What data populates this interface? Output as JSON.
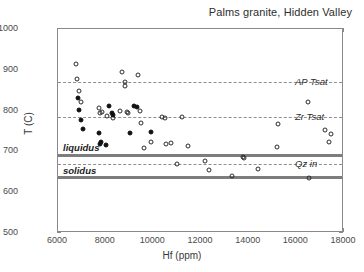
{
  "chart_data": {
    "type": "scatter",
    "title": "Palms granite, Hidden Valley",
    "xlabel": "Hf (ppm)",
    "ylabel": "T (C)",
    "xlim": [
      6000,
      18000
    ],
    "ylim": [
      500,
      1000
    ],
    "xticks": [
      6000,
      8000,
      10000,
      12000,
      14000,
      16000,
      18000
    ],
    "yticks": [
      500,
      600,
      700,
      800,
      900,
      1000
    ],
    "grid": false,
    "legend": "none",
    "series": [
      {
        "name": "open-circles",
        "marker": "open circle",
        "color": "#2b2b2b",
        "points": [
          [
            6750,
            915
          ],
          [
            6800,
            878
          ],
          [
            6870,
            848
          ],
          [
            6950,
            822
          ],
          [
            7700,
            806
          ],
          [
            7780,
            793
          ],
          [
            7850,
            797
          ],
          [
            8050,
            787
          ],
          [
            8300,
            783
          ],
          [
            8600,
            800
          ],
          [
            8700,
            894
          ],
          [
            8800,
            870
          ],
          [
            8820,
            861
          ],
          [
            8900,
            797
          ],
          [
            8950,
            795
          ],
          [
            9350,
            888
          ],
          [
            9450,
            800
          ],
          [
            9500,
            770
          ],
          [
            9600,
            708
          ],
          [
            9900,
            723
          ],
          [
            10350,
            785
          ],
          [
            10480,
            783
          ],
          [
            10550,
            717
          ],
          [
            10750,
            720
          ],
          [
            10980,
            668
          ],
          [
            11200,
            785
          ],
          [
            11450,
            713
          ],
          [
            12150,
            676
          ],
          [
            12350,
            655
          ],
          [
            13300,
            639
          ],
          [
            13750,
            686
          ],
          [
            13800,
            683
          ],
          [
            14400,
            658
          ],
          [
            15200,
            710
          ],
          [
            15250,
            767
          ],
          [
            16500,
            820
          ],
          [
            16550,
            634
          ],
          [
            17200,
            752
          ],
          [
            17350,
            723
          ],
          [
            17450,
            742
          ]
        ]
      },
      {
        "name": "filled-circles",
        "marker": "filled circle",
        "color": "#111111",
        "points": [
          [
            6830,
            832
          ],
          [
            6900,
            802
          ],
          [
            6950,
            776
          ],
          [
            7050,
            755
          ],
          [
            7700,
            745
          ],
          [
            7750,
            718
          ],
          [
            7800,
            722
          ],
          [
            8000,
            716
          ],
          [
            8150,
            812
          ],
          [
            8250,
            795
          ],
          [
            8300,
            790
          ],
          [
            9000,
            745
          ],
          [
            9200,
            812
          ],
          [
            9300,
            809
          ],
          [
            9900,
            747
          ]
        ]
      }
    ],
    "reference_lines": [
      {
        "name": "AP Tsat",
        "value": 870,
        "style": "dashed",
        "label_side": "right",
        "color": "#8f8f8f"
      },
      {
        "name": "Zr Tsat",
        "value": 785,
        "style": "dashed",
        "label_side": "right",
        "color": "#8f8f8f"
      },
      {
        "name": "Qz in",
        "value": 669,
        "style": "dashed",
        "label_side": "right",
        "color": "#8f8f8f"
      },
      {
        "name": "liquidus",
        "value": 690,
        "style": "band",
        "label_side": "left",
        "color": "#7d7d7d"
      },
      {
        "name": "solidus",
        "value": 635,
        "style": "band",
        "label_side": "left",
        "color": "#7d7d7d"
      }
    ]
  }
}
